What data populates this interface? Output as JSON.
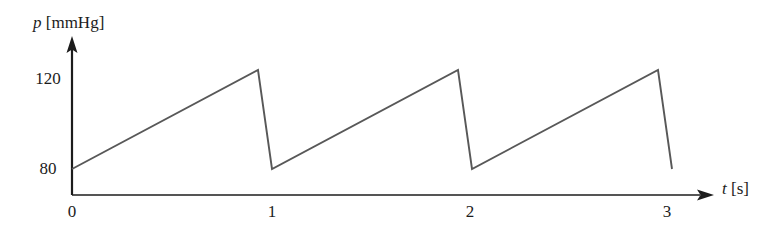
{
  "chart_data": {
    "type": "line",
    "title": "",
    "xlabel": "t [s]",
    "ylabel": "p [mmHg]",
    "xlabel_symbol": "t",
    "xlabel_unit": "[s]",
    "ylabel_symbol": "p",
    "ylabel_unit": "[mmHg]",
    "grid": false,
    "legend": "none",
    "xlim": [
      0,
      3.45
    ],
    "ylim": [
      72,
      132
    ],
    "xticks": [
      0,
      1,
      2,
      3
    ],
    "xtick_labels": [
      "0",
      "1",
      "2",
      "3"
    ],
    "yticks": [
      80,
      120
    ],
    "ytick_labels": [
      "80",
      "120"
    ],
    "series": [
      {
        "name": "arterial pressure",
        "description": "sawtooth pressure waveform, 3 cycles of 1 s period",
        "x": [
          0.0,
          0.93,
          1.0,
          1.0,
          1.93,
          2.0,
          2.0,
          2.93,
          3.0
        ],
        "y": [
          80,
          124,
          80,
          80,
          124,
          80,
          80,
          124,
          80
        ]
      }
    ],
    "annotations": {
      "baseline_pressure": 80,
      "peak_pressure": 124,
      "period_s": 1,
      "cycles": 3
    },
    "colors": {
      "axis": "#1c1c1c",
      "curve": "#4a4a4a",
      "background": "#ffffff"
    }
  },
  "axes": {
    "y_axis_name": "pressure-axis",
    "x_axis_name": "time-axis"
  }
}
